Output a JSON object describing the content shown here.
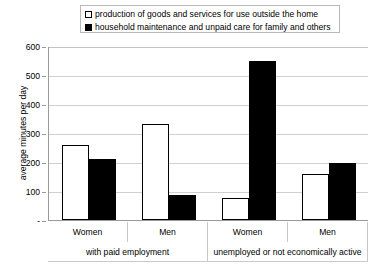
{
  "chart_data": {
    "type": "bar",
    "title": "",
    "xlabel": "",
    "ylabel": "average minutes per day",
    "ylim": [
      0,
      600
    ],
    "yticks": [
      "-",
      "100",
      "200",
      "300",
      "400",
      "500",
      "600"
    ],
    "grid": true,
    "legend_position": "top",
    "categories": [
      "Women",
      "Men",
      "Women",
      "Men"
    ],
    "group_labels": [
      "with paid employment",
      "unemployed or not economically active"
    ],
    "series": [
      {
        "name": "production of goods and services for use outside the home",
        "swatch": "hollow",
        "color": "#ffffff",
        "values": [
          260,
          330,
          75,
          160
        ]
      },
      {
        "name": "household maintenance and unpaid care for family and others",
        "swatch": "filled",
        "color": "#000000",
        "values": [
          210,
          85,
          550,
          195
        ]
      }
    ]
  },
  "legend": {
    "items": [
      {
        "label": "production of goods and services for use outside the home",
        "swatch": "hollow"
      },
      {
        "label": "household maintenance and unpaid care for family and others",
        "swatch": "filled"
      }
    ]
  },
  "axis": {
    "y_title": "average minutes per day",
    "y_ticks": [
      "600",
      "500",
      "400",
      "300",
      "200",
      "100",
      "-"
    ]
  },
  "xaxis": {
    "categories": [
      "Women",
      "Men",
      "Women",
      "Men"
    ],
    "groups": [
      "with paid employment",
      "unemployed or not economically active"
    ]
  }
}
